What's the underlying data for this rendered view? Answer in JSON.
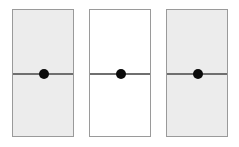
{
  "panels": [
    {
      "id": "panel-1",
      "fill": "shaded",
      "background": "#ececec",
      "has_line": true,
      "has_dot": true
    },
    {
      "id": "panel-2",
      "fill": "plain",
      "background": "#ffffff",
      "has_line": true,
      "has_dot": true
    },
    {
      "id": "panel-3",
      "fill": "shaded",
      "background": "#ececec",
      "has_line": true,
      "has_dot": true
    }
  ],
  "colors": {
    "border": "#9a9a9a",
    "line": "#6f6f6f",
    "dot": "#0a0a0a"
  }
}
